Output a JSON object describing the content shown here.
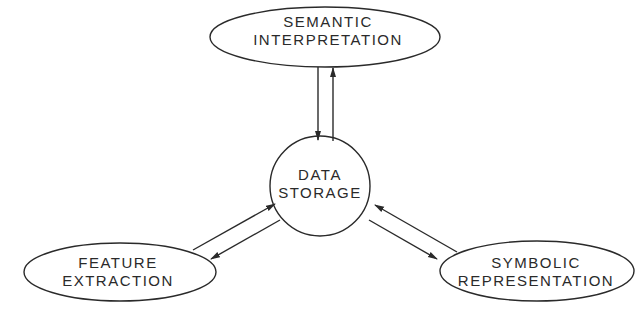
{
  "diagram": {
    "nodes": [
      {
        "id": "semantic",
        "line1": "SEMANTIC",
        "line2": "INTERPRETATION",
        "shape": "ellipse"
      },
      {
        "id": "storage",
        "line1": "DATA",
        "line2": "STORAGE",
        "shape": "circle"
      },
      {
        "id": "feature",
        "line1": "FEATURE",
        "line2": "EXTRACTION",
        "shape": "ellipse"
      },
      {
        "id": "symbolic",
        "line1": "SYMBOLIC",
        "line2": "REPRESENTATION",
        "shape": "ellipse"
      }
    ],
    "edges": [
      {
        "from": "semantic",
        "to": "storage"
      },
      {
        "from": "storage",
        "to": "semantic"
      },
      {
        "from": "feature",
        "to": "storage"
      },
      {
        "from": "storage",
        "to": "feature"
      },
      {
        "from": "symbolic",
        "to": "storage"
      },
      {
        "from": "storage",
        "to": "symbolic"
      }
    ],
    "colors": {
      "stroke": "#2a2a2a",
      "background": "#ffffff"
    }
  }
}
